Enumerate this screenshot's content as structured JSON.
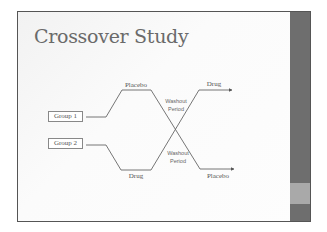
{
  "slide": {
    "title": "Crossover Study",
    "colors": {
      "side_band": "#6e6e6e",
      "side_band_accent": "#a9a9a9",
      "title": "#6a6a6a",
      "lines": "#666666"
    }
  },
  "diagram": {
    "groups": [
      {
        "label": "Group 1",
        "first_treatment": "Placebo",
        "second_treatment": "Drug"
      },
      {
        "label": "Group 2",
        "first_treatment": "Drug",
        "second_treatment": "Placebo"
      }
    ],
    "washout_labels": [
      {
        "line1": "Washout",
        "line2": "Period"
      },
      {
        "line1": "Washout",
        "line2": "Period"
      }
    ],
    "top_left_label": "Placebo",
    "bottom_left_label": "Drug",
    "top_right_label": "Drug",
    "bottom_right_label": "Placebo"
  }
}
